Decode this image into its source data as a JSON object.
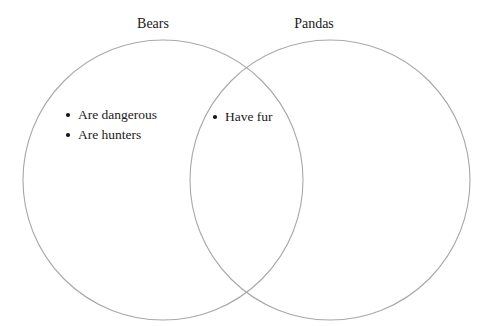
{
  "diagram": {
    "type": "venn-two-set",
    "background_color": "#ffffff",
    "stroke_color": "#a8a8a8",
    "text_color": "#1a1a1a",
    "bullet_glyph": "•",
    "left_set": {
      "title": "Bears",
      "only_items": [
        "Are dangerous",
        "Are hunters"
      ]
    },
    "right_set": {
      "title": "Pandas",
      "only_items": []
    },
    "intersection": {
      "items": [
        "Have fur"
      ]
    }
  }
}
